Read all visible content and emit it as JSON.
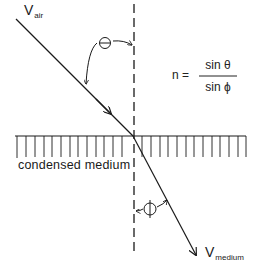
{
  "diagram": {
    "labels": {
      "incident_velocity_main": "V",
      "incident_velocity_sub": "air",
      "refracted_velocity_main": "V",
      "refracted_velocity_sub": "medium",
      "medium": "condensed medium",
      "angle_incident": "Θ",
      "angle_refracted": "Φ"
    },
    "formula": {
      "lhs": "n =",
      "numerator": "sin θ",
      "denominator": "sin ϕ"
    },
    "colors": {
      "line": "#1a1a1a",
      "background": "#ffffff"
    }
  }
}
